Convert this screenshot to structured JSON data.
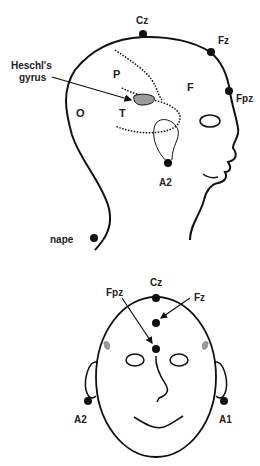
{
  "side_view": {
    "electrodes": {
      "cz": "Cz",
      "fz": "Fz",
      "fpz": "Fpz",
      "a2": "A2",
      "nape": "nape"
    },
    "regions": {
      "parietal": "P",
      "frontal": "F",
      "occipital": "O",
      "temporal": "T"
    },
    "annotation": {
      "line1": "Heschl's",
      "line2": "gyrus"
    }
  },
  "front_view": {
    "electrodes": {
      "cz": "Cz",
      "fpz": "Fpz",
      "fz": "Fz",
      "a2": "A2",
      "a1": "A1"
    }
  },
  "colors": {
    "stroke": "#111111",
    "gyrus_fill": "#9a9a9a",
    "background": "#ffffff"
  }
}
